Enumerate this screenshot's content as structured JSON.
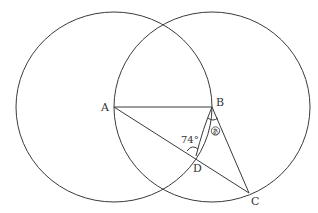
{
  "diagram": {
    "type": "geometry",
    "points": {
      "A": {
        "label": "A",
        "x": 114,
        "y": 107
      },
      "B": {
        "label": "B",
        "x": 212,
        "y": 107
      },
      "C": {
        "label": "C",
        "x": 249,
        "y": 193
      },
      "D": {
        "label": "D",
        "x": 196,
        "y": 156
      }
    },
    "circles": [
      {
        "name": "circle-A",
        "center": "A",
        "rx": 98,
        "ry": 95
      },
      {
        "name": "circle-B",
        "center": "B",
        "rx": 98,
        "ry": 95
      }
    ],
    "segments": [
      [
        "A",
        "B"
      ],
      [
        "A",
        "C"
      ],
      [
        "B",
        "D"
      ],
      [
        "B",
        "C"
      ]
    ],
    "angles": {
      "given": {
        "label": "74°",
        "at": "D",
        "between": [
          "A",
          "B"
        ]
      },
      "unknown": {
        "label": "あ",
        "at": "B",
        "between": [
          "D",
          "C"
        ]
      }
    },
    "stroke_color": "#3a3a3a",
    "background": "#ffffff"
  }
}
